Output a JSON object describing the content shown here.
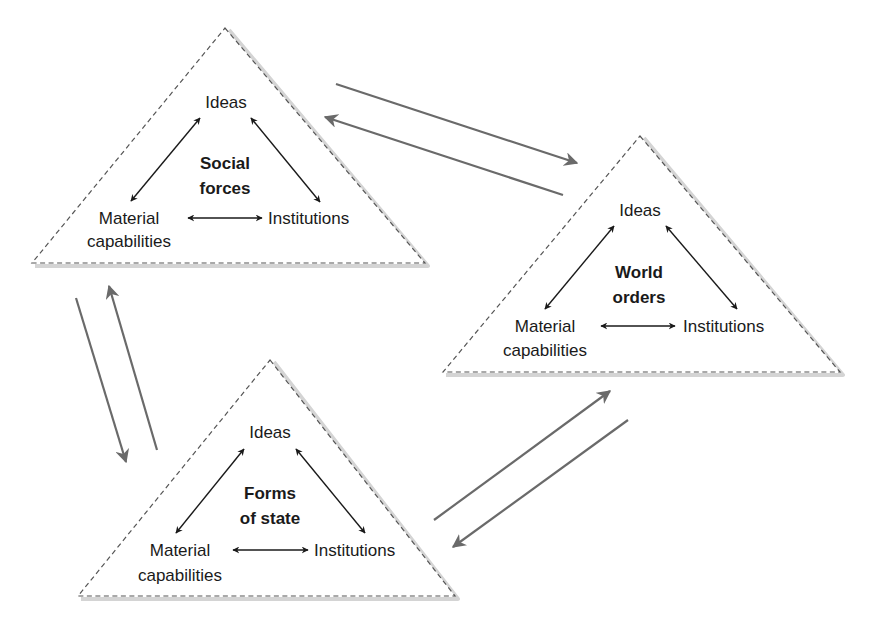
{
  "diagram": {
    "colors": {
      "background": "#ffffff",
      "triangle_border": "#555555",
      "triangle_shadow": "#d4d4d4",
      "inner_arrows": "#1a1a1a",
      "link_arrows": "#6a6a6a",
      "text": "#1a1a1a"
    },
    "triangles": [
      {
        "id": "social-forces",
        "title_line1": "Social",
        "title_line2": "forces",
        "top_node": "Ideas",
        "left_node_line1": "Material",
        "left_node_line2": "capabilities",
        "right_node": "Institutions"
      },
      {
        "id": "world-orders",
        "title_line1": "World",
        "title_line2": "orders",
        "top_node": "Ideas",
        "left_node_line1": "Material",
        "left_node_line2": "capabilities",
        "right_node": "Institutions"
      },
      {
        "id": "forms-of-state",
        "title_line1": "Forms",
        "title_line2": "of state",
        "top_node": "Ideas",
        "left_node_line1": "Material",
        "left_node_line2": "capabilities",
        "right_node": "Institutions"
      }
    ],
    "links": [
      {
        "from": "Social forces",
        "to": "World orders"
      },
      {
        "from": "World orders",
        "to": "Social forces"
      },
      {
        "from": "Social forces",
        "to": "Forms of state"
      },
      {
        "from": "Forms of state",
        "to": "Social forces"
      },
      {
        "from": "Forms of state",
        "to": "World orders"
      },
      {
        "from": "World orders",
        "to": "Forms of state"
      }
    ]
  }
}
